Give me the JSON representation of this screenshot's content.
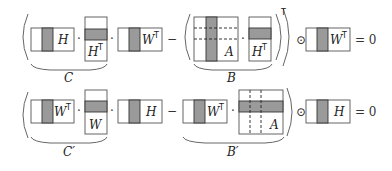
{
  "equations": [
    {
      "row": 1,
      "terms": {
        "c_left_label": "H",
        "c_mid_label": "H",
        "c_mid_sup": "T",
        "c_right_label": "W",
        "c_right_sup": "T",
        "b_left_label": "A",
        "b_right_label": "H",
        "b_right_sup": "T",
        "outer_sup": "T",
        "hadamard_label": "W",
        "hadamard_sup": "T"
      },
      "brace_c": "C",
      "brace_b": "B",
      "result": "= 0"
    },
    {
      "row": 2,
      "terms": {
        "c_left_label": "W",
        "c_left_sup": "T",
        "c_mid_label": "W",
        "c_right_label": "H",
        "b_left_label": "W",
        "b_left_sup": "T",
        "b_right_label": "A",
        "hadamard_label": "H"
      },
      "brace_c": "C′",
      "brace_b": "B′",
      "result": "= 0"
    }
  ],
  "operators": {
    "dot": "·",
    "minus": "−",
    "hadamard": "⊙"
  }
}
